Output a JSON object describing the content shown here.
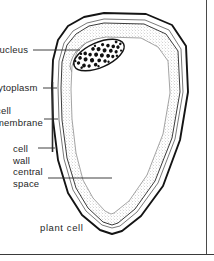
{
  "figure": {
    "caption": "plant cell",
    "title": "plant cell",
    "labels": [
      {
        "id": "nucleus",
        "text": "nucleus",
        "text2": ""
      },
      {
        "id": "cytoplasm",
        "text": "cytoplasm",
        "text2": ""
      },
      {
        "id": "cell-membrane",
        "text": "cell",
        "text2": "membrane"
      },
      {
        "id": "cell-wall",
        "text": "cell",
        "text2": "wall"
      },
      {
        "id": "central-space",
        "text": "central",
        "text2": "space"
      }
    ],
    "colors": {
      "outline": "#1a1a1a",
      "inner_line": "#4a4a4a",
      "stipple": "#9a9a9a",
      "nucleus": "#111111",
      "leader": "#2b2b2b",
      "background": "#ffffff",
      "rule": "#3a3a3a"
    },
    "structures": [
      {
        "name": "cell wall",
        "note": "outer heavy boundary of the cell"
      },
      {
        "name": "cell membrane",
        "note": "thin line inside the cell wall"
      },
      {
        "name": "cytoplasm",
        "note": "stippled band lining the inside"
      },
      {
        "name": "central space",
        "note": "large clear vacuole region in the middle"
      },
      {
        "name": "nucleus",
        "note": "dark stippled ellipse at the upper left"
      }
    ]
  }
}
